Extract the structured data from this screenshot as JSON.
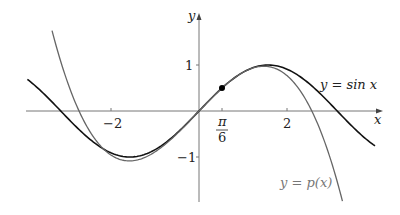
{
  "chart_data": {
    "type": "line",
    "title": "",
    "xlabel": "x",
    "ylabel": "y",
    "xlim": [
      -3.9,
      4.2
    ],
    "ylim": [
      -2.0,
      2.1
    ],
    "x_ticks": [
      {
        "value": -2,
        "label": "−2"
      },
      {
        "value": 0.5236,
        "label_num": "π",
        "label_den": "6"
      },
      {
        "value": 2,
        "label": "2"
      }
    ],
    "y_ticks": [
      {
        "value": 1,
        "label": "1"
      },
      {
        "value": -1,
        "label": "−1"
      }
    ],
    "grid": false,
    "series": [
      {
        "name": "y = sin x",
        "function": "sin(x)",
        "color": "#111111",
        "x_range": [
          -3.9,
          4.0
        ]
      },
      {
        "name": "y = p(x)",
        "function": "cubic Taylor polynomial of sin x about π/6",
        "color": "#666666",
        "x_range": [
          -3.34,
          3.26
        ]
      }
    ],
    "marked_point": {
      "x": 0.5236,
      "y": 0.5,
      "label": "(π/6, 1/2)"
    },
    "annotations": [
      {
        "text": "y = sin x",
        "x": 2.6,
        "y": 0.85
      },
      {
        "text": "y = p(x)",
        "x": 1.35,
        "y": -2.0
      }
    ]
  },
  "labels": {
    "x_axis": "x",
    "y_axis": "y",
    "tick_neg2": "−2",
    "tick_2": "2",
    "tick_pi": "π",
    "tick_6": "6",
    "tick_1": "1",
    "tick_neg1": "−1",
    "sin_label": "y = sin x",
    "p_label": "y = p(x)"
  }
}
